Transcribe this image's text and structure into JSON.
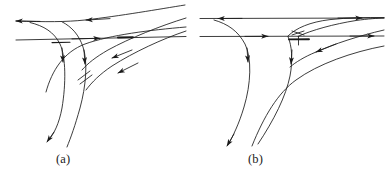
{
  "figure": {
    "kind": "line-diagram",
    "background_color": "#ffffff",
    "stroke_color": "#1a1a1a",
    "panels": [
      {
        "id": "a",
        "caption": "(a)",
        "description": "Streamline / trajectory topology diagram, left panel"
      },
      {
        "id": "b",
        "caption": "(b)",
        "description": "Streamline / trajectory topology diagram, right panel"
      }
    ]
  },
  "captions": {
    "a": "(a)",
    "b": "(b)"
  },
  "colors": {
    "ink": "#1a1a1a",
    "paper": "#ffffff"
  }
}
